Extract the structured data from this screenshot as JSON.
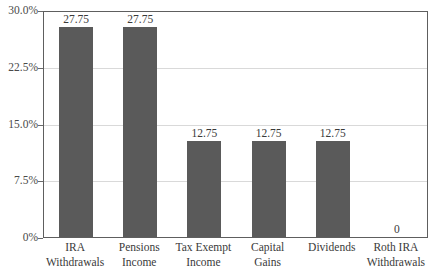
{
  "chart_data": {
    "type": "bar",
    "title": "",
    "subtitle": "",
    "xlabel": "",
    "ylabel": "",
    "ylim": [
      0,
      30
    ],
    "grid": true,
    "legend": "none",
    "orientation": "vertical",
    "bar_color": "#5a5a5a",
    "gridline_color": "#d9d9d9",
    "frame_color": "#5e5e5e",
    "text_color": "#3a3a3a",
    "y_ticks": [
      {
        "value": 30.0,
        "label": "30.0%"
      },
      {
        "value": 22.5,
        "label": "22.5%"
      },
      {
        "value": 15.0,
        "label": "15.0%"
      },
      {
        "value": 7.5,
        "label": "7.5%"
      },
      {
        "value": 0,
        "label": "0%"
      }
    ],
    "categories": [
      "IRA Withdrawals",
      "Pensions Income",
      "Tax Exempt Income",
      "Capital Gains",
      "Dividends",
      "Roth IRA Withdrawals"
    ],
    "category_lines": [
      {
        "line1": "IRA",
        "line2": "Withdrawals"
      },
      {
        "line1": "Pensions",
        "line2": "Income"
      },
      {
        "line1": "Tax Exempt",
        "line2": "Income"
      },
      {
        "line1": "Capital",
        "line2": "Gains"
      },
      {
        "line1": "Dividends",
        "line2": ""
      },
      {
        "line1": "Roth IRA",
        "line2": "Withdrawals"
      }
    ],
    "values": [
      27.75,
      27.75,
      12.75,
      12.75,
      12.75,
      0
    ],
    "data_labels": [
      "27.75",
      "27.75",
      "12.75",
      "12.75",
      "12.75",
      "0"
    ]
  }
}
